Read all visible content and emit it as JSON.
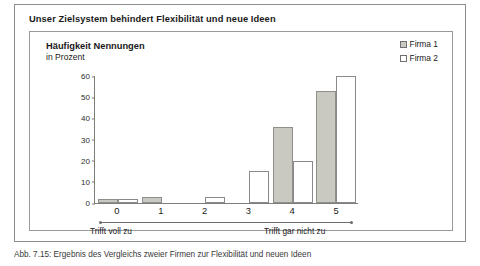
{
  "figure": {
    "title": "Unser Zielsystem behindert Flexibilität und neue Ideen",
    "caption": "Abb. 7.15: Ergebnis des Vergleichs zweier Firmen zur Flexibilität und neuen Ideen"
  },
  "panel": {
    "heading_line1": "Häufigkeit Nennungen",
    "heading_line2": "in Prozent"
  },
  "legend": {
    "position": "top-right",
    "entries": [
      {
        "label": "Firma 1",
        "color": "#c9c9c2",
        "border": "#6f6f6f"
      },
      {
        "label": "Firma 2",
        "color": "#ffffff",
        "border": "#6f6f6f"
      }
    ]
  },
  "axis": {
    "anchor_left": "Trifft voll zu",
    "anchor_right": "Trifft gar nicht zu",
    "yticks": [
      "60",
      "50",
      "40",
      "30",
      "20",
      "10",
      "0"
    ]
  },
  "chart_data": {
    "type": "bar",
    "title": "Unser Zielsystem behindert Flexibilität und neue Ideen",
    "subtitle": "Häufigkeit Nennungen in Prozent",
    "xlabel": "",
    "ylabel": "Häufigkeit Nennungen in Prozent",
    "categories": [
      "0",
      "1",
      "2",
      "3",
      "4",
      "5"
    ],
    "series": [
      {
        "name": "Firma 1",
        "color": "#c9c9c2",
        "values": [
          2,
          3,
          0,
          0,
          36,
          53
        ]
      },
      {
        "name": "Firma 2",
        "color": "#ffffff",
        "values": [
          2,
          0,
          3,
          15,
          20,
          60
        ]
      }
    ],
    "ylim": [
      0,
      60
    ],
    "ytick_step": 10,
    "grid": false,
    "legend_position": "top-right",
    "annotations": {
      "scale_left": "Trifft voll zu",
      "scale_right": "Trifft gar nicht zu"
    }
  }
}
